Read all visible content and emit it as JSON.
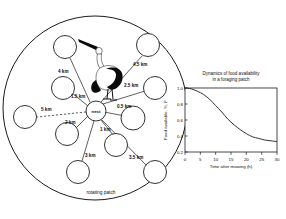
{
  "figure": {
    "caption_bottom": "rotating patch",
    "nest_label": "nest",
    "bird_icon": "stork-icon"
  },
  "diagram": {
    "type": "foraging-radius-diagram",
    "center_label": "nest",
    "outer_label": "rotating patch",
    "patches": [
      {
        "id": "p1",
        "label": "0.5 km",
        "distance_km": 0.5,
        "angle_deg": 5,
        "cx": 133.0,
        "cy": 118.0,
        "r": 12.0,
        "lx": 117.0,
        "ly": 108.0
      },
      {
        "id": "p2",
        "label": "1 km",
        "distance_km": 1.0,
        "angle_deg": 68,
        "cx": 116.0,
        "cy": 145.0,
        "r": 11.5,
        "lx": 100.0,
        "ly": 131.0
      },
      {
        "id": "p3",
        "label": "1.5 km",
        "distance_km": 1.5,
        "angle_deg": 196,
        "cx": 63.0,
        "cy": 88.0,
        "r": 11.5,
        "lx": 76.0,
        "ly": 96.0
      },
      {
        "id": "p4",
        "label": "2 km",
        "distance_km": 2.0,
        "angle_deg": 140,
        "cx": 67.0,
        "cy": 134.0,
        "r": 11.5,
        "lx": 71.0,
        "ly": 125.0
      },
      {
        "id": "p5",
        "label": "2.5 km",
        "distance_km": 2.5,
        "angle_deg": 330,
        "cx": 155.0,
        "cy": 88.0,
        "r": 11.5,
        "lx": 128.0,
        "ly": 86.0
      },
      {
        "id": "p6",
        "label": "3 km",
        "distance_km": 3.0,
        "angle_deg": 112,
        "cx": 78.0,
        "cy": 172.0,
        "r": 11.5,
        "lx": 86.0,
        "ly": 156.0
      },
      {
        "id": "p7",
        "label": "3.5 km",
        "distance_km": 3.5,
        "angle_deg": 58,
        "cx": 155.0,
        "cy": 172.0,
        "r": 11.5,
        "lx": 133.0,
        "ly": 158.0
      },
      {
        "id": "p8",
        "label": "4 km",
        "distance_km": 4.0,
        "angle_deg": 232,
        "cx": 65.0,
        "cy": 47.0,
        "r": 11.5,
        "lx": 65.0,
        "ly": 73.0
      },
      {
        "id": "p9",
        "label": "4.5 km",
        "distance_km": 4.5,
        "angle_deg": 310,
        "cx": 148.0,
        "cy": 45.0,
        "r": 11.5,
        "lx": 138.0,
        "ly": 67.0
      },
      {
        "id": "p10",
        "label": "5 km",
        "distance_km": 5.0,
        "angle_deg": 180,
        "cx": 25.0,
        "cy": 117.0,
        "r": 11.5,
        "lx": 41.0,
        "ly": 113.0
      }
    ]
  },
  "chart_data": {
    "type": "line",
    "title": "Dynamics of food availability in a foraging patch",
    "title_line1": "Dynamics of food availability",
    "title_line2": "in a foraging patch",
    "xlabel": "Time after mowing (h)",
    "ylabel": "Food available, %, F",
    "xlim": [
      0,
      30
    ],
    "ylim": [
      0.2,
      1.0
    ],
    "xticks": [
      0,
      5,
      10,
      15,
      20,
      25,
      30
    ],
    "yticks": [
      0.2,
      0.4,
      0.6,
      0.8,
      1.0
    ],
    "xtick_labels": [
      "0",
      "5",
      "10",
      "15",
      "20",
      "25",
      "30"
    ],
    "ytick_labels": [
      "0.2",
      "0.4",
      "0.6",
      "0.8",
      "1.0"
    ],
    "grid": false,
    "legend": null,
    "series": [
      {
        "name": "food availability",
        "x": [
          0,
          2,
          4,
          6,
          8,
          10,
          12,
          14,
          16,
          18,
          20,
          22,
          24,
          26,
          28,
          30
        ],
        "y": [
          1.0,
          0.99,
          0.96,
          0.92,
          0.86,
          0.78,
          0.7,
          0.61,
          0.54,
          0.48,
          0.43,
          0.39,
          0.37,
          0.35,
          0.34,
          0.33
        ]
      }
    ]
  }
}
